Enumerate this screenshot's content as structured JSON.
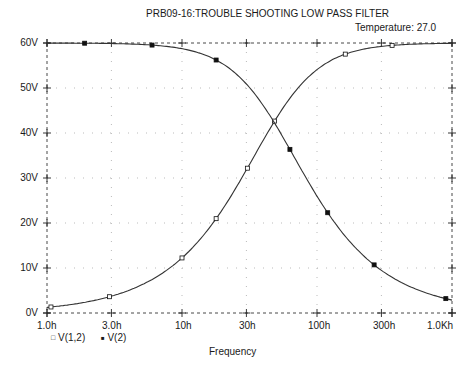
{
  "header": {
    "title": "PRB09-16:TROUBLE SHOOTING LOW PASS FILTER",
    "temperature": "Temperature:  27.0"
  },
  "chart_data": {
    "type": "line",
    "title": "PRB09-16:TROUBLE SHOOTING LOW PASS FILTER",
    "subtitle": "Temperature: 27.0",
    "xlabel": "Frequency",
    "ylabel": "",
    "xscale": "log",
    "xlim": [
      1,
      1000
    ],
    "ylim": [
      0,
      60
    ],
    "grid": true,
    "legend_position": "bottom-left",
    "x_tick_labels": [
      "1.0h",
      "3.0h",
      "10h",
      "30h",
      "100h",
      "300h",
      "1.0Kh"
    ],
    "x_ticks": [
      1,
      3,
      10,
      30,
      100,
      300,
      1000
    ],
    "y_tick_labels": [
      "0V",
      "10V",
      "20V",
      "30V",
      "40V",
      "50V",
      "60V"
    ],
    "y_ticks": [
      0,
      10,
      20,
      30,
      40,
      50,
      60
    ],
    "x": [
      1,
      2,
      3,
      5,
      10,
      17.9,
      20,
      30,
      40,
      48,
      60,
      80,
      100,
      150,
      200,
      300,
      500,
      1000
    ],
    "series": [
      {
        "name": "V(1,2)",
        "marker": "hollow-square",
        "values": [
          1.25,
          2.5,
          3.74,
          6.22,
          12.24,
          20.96,
          23.08,
          31.8,
          38.41,
          42.43,
          46.85,
          51.45,
          54.09,
          57.15,
          58.35,
          59.25,
          59.72,
          59.93
        ],
        "marker_x": [
          1.07,
          2.9,
          10,
          17.9,
          30.5,
          48.5,
          162,
          360
        ]
      },
      {
        "name": "V(2)",
        "marker": "filled-square",
        "values": [
          59.99,
          59.95,
          59.88,
          59.68,
          58.74,
          56.21,
          55.39,
          50.88,
          46.1,
          42.43,
          37.48,
          30.87,
          26.04,
          18.35,
          14.08,
          9.48,
          5.73,
          2.88
        ],
        "marker_x": [
          1.9,
          6.0,
          17.9,
          63,
          120,
          265,
          900
        ]
      }
    ],
    "cutoff_frequency_est": 48,
    "crossing_value_est": 42.4
  },
  "axes": {
    "y_labels": [
      "60V",
      "50V",
      "40V",
      "30V",
      "20V",
      "10V",
      "0V"
    ],
    "x_labels": [
      "1.0h",
      "3.0h",
      "10h",
      "30h",
      "100h",
      "300h",
      "1.0Kh"
    ],
    "x_title": "Frequency"
  },
  "legend": {
    "items": [
      {
        "label": "V(1,2)",
        "symbol": "□"
      },
      {
        "label": "V(2)",
        "symbol": "■"
      }
    ]
  }
}
